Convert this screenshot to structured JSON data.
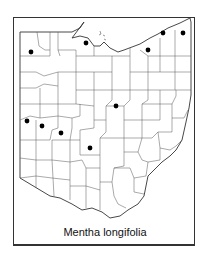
{
  "map": {
    "region": "Ohio",
    "subdivisions": "counties",
    "caption": "Mentha longifolia",
    "colors": {
      "border": "#333333",
      "county_line": "#555555",
      "dot": "#000000",
      "background": "#ffffff"
    },
    "occurrence_dots": [
      {
        "x": 31,
        "y": 52
      },
      {
        "x": 86,
        "y": 43
      },
      {
        "x": 148,
        "y": 50
      },
      {
        "x": 163,
        "y": 33
      },
      {
        "x": 183,
        "y": 33
      },
      {
        "x": 116,
        "y": 106
      },
      {
        "x": 27,
        "y": 121
      },
      {
        "x": 42,
        "y": 126
      },
      {
        "x": 61,
        "y": 133
      },
      {
        "x": 90,
        "y": 148
      }
    ]
  }
}
